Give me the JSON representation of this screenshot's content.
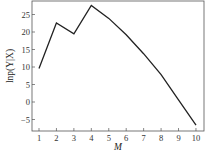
{
  "chart_data": {
    "type": "line",
    "title": "",
    "xlabel": "M",
    "ylabel": "lnp(Y|X)",
    "x": [
      1,
      2,
      3,
      4,
      5,
      6,
      7,
      8,
      9,
      10
    ],
    "series": [
      {
        "name": "lnp(Y|X)",
        "values": [
          9.6,
          22.6,
          19.5,
          27.6,
          23.9,
          19.2,
          13.8,
          7.8,
          0.6,
          -6.6
        ]
      }
    ],
    "xticks": [
      "1",
      "2",
      "3",
      "4",
      "5",
      "6",
      "7",
      "8",
      "9",
      "10"
    ],
    "yticks": [
      "-5",
      "0",
      "5",
      "10",
      "15",
      "20",
      "25"
    ],
    "xlim": [
      0.6,
      10.4
    ],
    "ylim": [
      -8,
      29
    ],
    "grid": false,
    "legend": null
  }
}
